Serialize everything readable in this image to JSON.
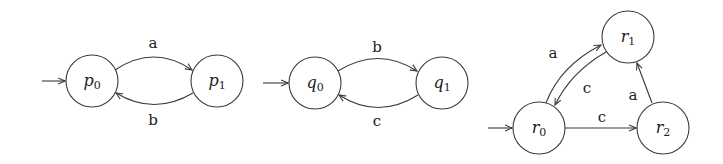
{
  "automata": [
    {
      "name": "P",
      "states": [
        {
          "id": "p0",
          "base": "p",
          "sub": "0",
          "x": 92,
          "y": 81,
          "initial": true
        },
        {
          "id": "p1",
          "base": "p",
          "sub": "1",
          "x": 217,
          "y": 81
        }
      ],
      "transitions": [
        {
          "from": "p0",
          "to": "p1",
          "label": "a"
        },
        {
          "from": "p1",
          "to": "p0",
          "label": "b"
        }
      ]
    },
    {
      "name": "Q",
      "states": [
        {
          "id": "q0",
          "base": "q",
          "sub": "0",
          "x": 315,
          "y": 83,
          "initial": true
        },
        {
          "id": "q1",
          "base": "q",
          "sub": "1",
          "x": 442,
          "y": 83
        }
      ],
      "transitions": [
        {
          "from": "q0",
          "to": "q1",
          "label": "b"
        },
        {
          "from": "q1",
          "to": "q0",
          "label": "c"
        }
      ]
    },
    {
      "name": "R",
      "states": [
        {
          "id": "r0",
          "base": "r",
          "sub": "0",
          "x": 539,
          "y": 128,
          "initial": true
        },
        {
          "id": "r1",
          "base": "r",
          "sub": "1",
          "x": 628,
          "y": 37
        },
        {
          "id": "r2",
          "base": "r",
          "sub": "2",
          "x": 663,
          "y": 128
        }
      ],
      "transitions": [
        {
          "from": "r0",
          "to": "r1",
          "label": "a"
        },
        {
          "from": "r1",
          "to": "r0",
          "label": "c"
        },
        {
          "from": "r0",
          "to": "r2",
          "label": "c"
        },
        {
          "from": "r2",
          "to": "r1",
          "label": "a"
        }
      ]
    }
  ],
  "labels": {
    "p0": {
      "base": "p",
      "sub": "0"
    },
    "p1": {
      "base": "p",
      "sub": "1"
    },
    "q0": {
      "base": "q",
      "sub": "0"
    },
    "q1": {
      "base": "q",
      "sub": "1"
    },
    "r0": {
      "base": "r",
      "sub": "0"
    },
    "r1": {
      "base": "r",
      "sub": "1"
    },
    "r2": {
      "base": "r",
      "sub": "2"
    },
    "p0_p1": "a",
    "p1_p0": "b",
    "q0_q1": "b",
    "q1_q0": "c",
    "r0_r1": "a",
    "r1_r0": "c",
    "r0_r2": "c",
    "r2_r1": "a"
  },
  "colors": {
    "stroke": "#3a3a3a",
    "text": "#222222",
    "background": "#ffffff"
  }
}
